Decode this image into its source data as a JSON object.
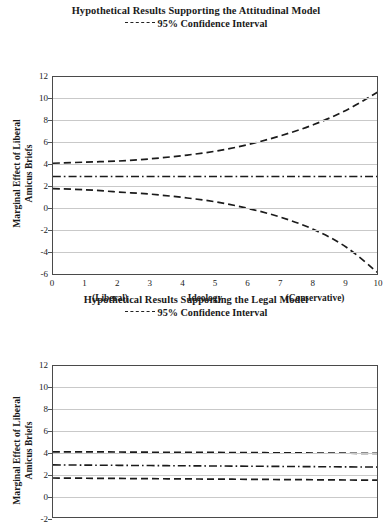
{
  "page": {
    "background": "#ffffff",
    "line_color": "#1b1b1b",
    "grid_color": "#c9c9c9",
    "frame_color": "#4a4a4a"
  },
  "figures": [
    {
      "id": "attitudinal",
      "title": "Hypothetical Results Supporting the Attitudinal Model",
      "legend_label": "95% Confidence Interval",
      "ylabel_line1": "Marginal Effect of Liberal",
      "ylabel_line2": "Amicus Briefs",
      "xlabel": "Ideology",
      "xannot_left": "(Liberal)",
      "xannot_right": "(Conservative)",
      "yticks": [
        "12",
        "10",
        "8",
        "6",
        "4",
        "2",
        "0",
        "-2",
        "-4",
        "-6"
      ],
      "xticks": [
        "0",
        "1",
        "2",
        "3",
        "4",
        "5",
        "6",
        "7",
        "8",
        "9",
        "10"
      ]
    },
    {
      "id": "legal",
      "title": "Hypothetical Results Supporting the Legal Model",
      "legend_label": "95% Confidence Interval",
      "ylabel_line1": "Marginal Effect of Liberal",
      "ylabel_line2": "Amicus Briefs",
      "yticks": [
        "12",
        "10",
        "8",
        "6",
        "4",
        "2",
        "0",
        "-2"
      ],
      "xticks": []
    }
  ],
  "chart_data": [
    {
      "type": "line",
      "id": "attitudinal",
      "title": "Hypothetical Results Supporting the Attitudinal Model",
      "subtitle": "95% Confidence Interval",
      "xlabel": "Ideology",
      "ylabel": "Marginal Effect of Liberal Amicus Briefs",
      "xlim": [
        0,
        10
      ],
      "ylim": [
        -6,
        12
      ],
      "ytick_step": 2,
      "grid": "horizontal",
      "legend": "above-plot",
      "x_axis_annotations": [
        {
          "at": 1.5,
          "text": "(Liberal)"
        },
        {
          "at": 5.0,
          "text": "Ideology"
        },
        {
          "at": 8.5,
          "text": "(Conservative)"
        }
      ],
      "x": [
        0,
        1,
        2,
        3,
        4,
        5,
        6,
        7,
        8,
        9,
        10
      ],
      "series": [
        {
          "name": "Upper 95% Confidence Interval",
          "style": "dashed",
          "values": [
            4.2,
            4.3,
            4.4,
            4.6,
            4.9,
            5.3,
            5.9,
            6.7,
            7.7,
            9.0,
            10.7
          ]
        },
        {
          "name": "Point estimate",
          "style": "dash-dot",
          "values": [
            3.0,
            3.0,
            3.0,
            3.0,
            3.0,
            3.0,
            3.0,
            3.0,
            3.0,
            3.0,
            3.0
          ]
        },
        {
          "name": "Lower 95% Confidence Interval",
          "style": "dashed",
          "values": [
            1.9,
            1.8,
            1.6,
            1.4,
            1.1,
            0.7,
            0.1,
            -0.7,
            -1.8,
            -3.4,
            -5.8
          ]
        }
      ]
    },
    {
      "type": "line",
      "id": "legal",
      "title": "Hypothetical Results Supporting the Legal Model",
      "subtitle": "95% Confidence Interval",
      "xlabel": "",
      "ylabel": "Marginal Effect of Liberal Amicus Briefs",
      "xlim": [
        0,
        10
      ],
      "ylim": [
        -2,
        12
      ],
      "ytick_step": 2,
      "grid": "horizontal",
      "legend": "above-plot",
      "note": "lower portion of plot cropped by image edge",
      "x": [
        0,
        1,
        2,
        3,
        4,
        5,
        6,
        7,
        8,
        9,
        10
      ],
      "series": [
        {
          "name": "Upper 95% Confidence Interval",
          "style": "dashed",
          "values": [
            4.15,
            4.14,
            4.13,
            4.11,
            4.1,
            4.09,
            4.07,
            4.06,
            4.04,
            4.02,
            4.0
          ]
        },
        {
          "name": "Point estimate",
          "style": "dash-dot",
          "values": [
            2.95,
            2.93,
            2.91,
            2.89,
            2.87,
            2.85,
            2.83,
            2.81,
            2.79,
            2.77,
            2.75
          ]
        },
        {
          "name": "Lower 95% Confidence Interval",
          "style": "dashed",
          "values": [
            1.75,
            1.73,
            1.71,
            1.69,
            1.67,
            1.65,
            1.63,
            1.61,
            1.59,
            1.57,
            1.55
          ]
        }
      ]
    }
  ]
}
